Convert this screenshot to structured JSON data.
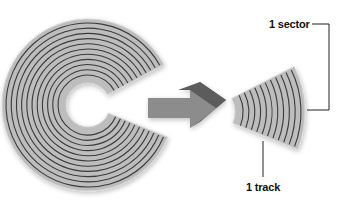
{
  "diagram": {
    "title": "",
    "labels": {
      "sector": "1 sector",
      "track": "1 track"
    },
    "disk": {
      "center": [
        88,
        105
      ],
      "outer_radius": 86,
      "inner_radius": 22,
      "track_count": 11,
      "cutout_angle_deg": [
        -28,
        22
      ]
    },
    "sector_piece": {
      "center": [
        88,
        105
      ],
      "offset": [
        60,
        5
      ],
      "angle_deg": [
        -28,
        22
      ]
    },
    "colors": {
      "disk_fill": "#bdbdbd",
      "disk_edge": "#d6d6d6",
      "track_line": "#3a3a3a",
      "arrow_light": "#8c8c8c",
      "arrow_dark": "#5c5c5c",
      "callout_line": "#222222",
      "background": "#ffffff"
    }
  }
}
